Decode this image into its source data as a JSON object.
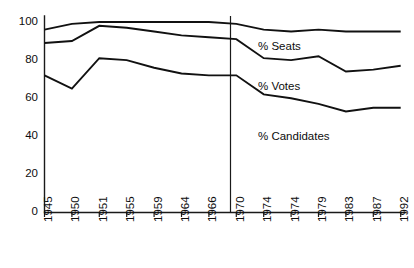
{
  "chart_data": {
    "type": "line",
    "title": "",
    "subtitle": "",
    "xlabel": "",
    "ylabel": "",
    "ylim": [
      0,
      100
    ],
    "yticks": [
      0,
      20,
      40,
      60,
      80,
      100
    ],
    "grid": false,
    "legend_position": "inline-right",
    "categories": [
      "1945",
      "1950",
      "1951",
      "1955",
      "1959",
      "1964",
      "1966",
      "1970",
      "1974",
      "1974",
      "1979",
      "1983",
      "1987",
      "1992"
    ],
    "annotations": [
      {
        "name": "divider-1970",
        "type": "vertical-line",
        "at_category": "1970",
        "label": ""
      }
    ],
    "series": [
      {
        "name": "% Seats",
        "label": "% Seats",
        "color": "#111111",
        "values": [
          96,
          99,
          100,
          100,
          100,
          100,
          100,
          99,
          96,
          95,
          96,
          95,
          95,
          95
        ]
      },
      {
        "name": "% Votes",
        "label": "% Votes",
        "color": "#111111",
        "values": [
          89,
          90,
          98,
          97,
          95,
          93,
          92,
          91,
          81,
          80,
          82,
          74,
          75,
          77
        ]
      },
      {
        "name": "% Candidates",
        "label": "% Candidates",
        "color": "#111111",
        "values": [
          72,
          65,
          81,
          80,
          76,
          73,
          72,
          72,
          62,
          60,
          57,
          53,
          55,
          55
        ]
      }
    ]
  },
  "labels": {
    "seats": "% Seats",
    "votes": "% Votes",
    "candidates": "% Candidates"
  },
  "yticks": {
    "t0": "0",
    "t20": "20",
    "t40": "40",
    "t60": "60",
    "t80": "80",
    "t100": "100"
  },
  "xticks": {
    "x0": "1945",
    "x1": "1950",
    "x2": "1951",
    "x3": "1955",
    "x4": "1959",
    "x5": "1964",
    "x6": "1966",
    "x7": "1970",
    "x8": "1974",
    "x9": "1974",
    "x10": "1979",
    "x11": "1983",
    "x12": "1987",
    "x13": "1992"
  }
}
